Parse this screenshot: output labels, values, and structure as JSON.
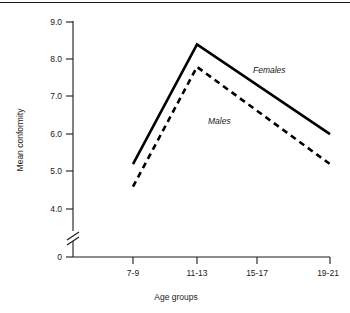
{
  "chart_data": {
    "type": "line",
    "title": "",
    "subtitle": "",
    "xlabel": "Age groups",
    "ylabel": "Mean conformity",
    "categories": [
      "7-9",
      "11-13",
      "15-17",
      "19-21"
    ],
    "series": [
      {
        "name": "Females",
        "style": "solid",
        "values": [
          5.2,
          8.4,
          7.2,
          6.0
        ]
      },
      {
        "name": "Males",
        "style": "dashed",
        "values": [
          4.6,
          7.8,
          6.5,
          5.2
        ]
      }
    ],
    "ylim": [
      4.0,
      9.0
    ],
    "yticks": [
      "0",
      "4.0",
      "5.0",
      "6.0",
      "7.0",
      "8.0",
      "9.0"
    ],
    "y_axis_break": true,
    "y_axis_break_symbol": "//",
    "grid": false,
    "legend": "inline-annotations",
    "annotations": [
      {
        "text": "Females",
        "series": "Females"
      },
      {
        "text": "Males",
        "series": "Males"
      }
    ]
  },
  "axes": {
    "y_title": "Mean conformity",
    "x_title": "Age groups",
    "y_tick_labels": {
      "t0": "0",
      "t4": "4.0",
      "t5": "5.0",
      "t6": "6.0",
      "t7": "7.0",
      "t8": "8.0",
      "t9": "9.0"
    },
    "x_tick_labels": {
      "c0": "7-9",
      "c1": "11-13",
      "c2": "15-17",
      "c3": "19-21"
    }
  },
  "labels": {
    "females": "Females",
    "males": "Males"
  },
  "colors": {
    "line": "#000000",
    "axis": "#1a1a1a",
    "background": "#ffffff"
  }
}
